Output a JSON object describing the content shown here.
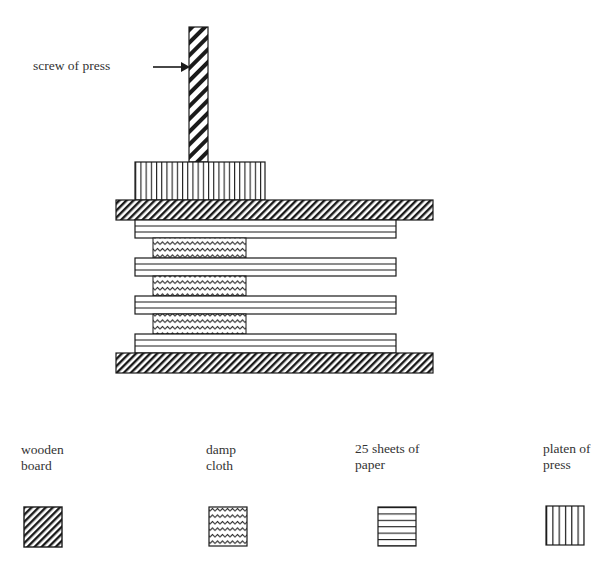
{
  "diagram": {
    "callout": {
      "label": "screw of press"
    },
    "layers_top_to_bottom": [
      "screw of press",
      "platen of press",
      "wooden board",
      "25 sheets of paper",
      "damp cloth",
      "25 sheets of paper",
      "damp cloth",
      "25 sheets of paper",
      "damp cloth",
      "25 sheets of paper",
      "wooden board"
    ]
  },
  "legend": {
    "items": [
      {
        "label": "wooden\nboard",
        "pattern": "diagonal-hatch"
      },
      {
        "label": "damp\ncloth",
        "pattern": "wavy-lines"
      },
      {
        "label": "25 sheets of\npaper",
        "pattern": "horizontal-lines"
      },
      {
        "label": "platen of\npress",
        "pattern": "vertical-lines"
      }
    ]
  },
  "colors": {
    "ink": "#1a1a1a",
    "background": "#ffffff",
    "text": "#333333"
  }
}
